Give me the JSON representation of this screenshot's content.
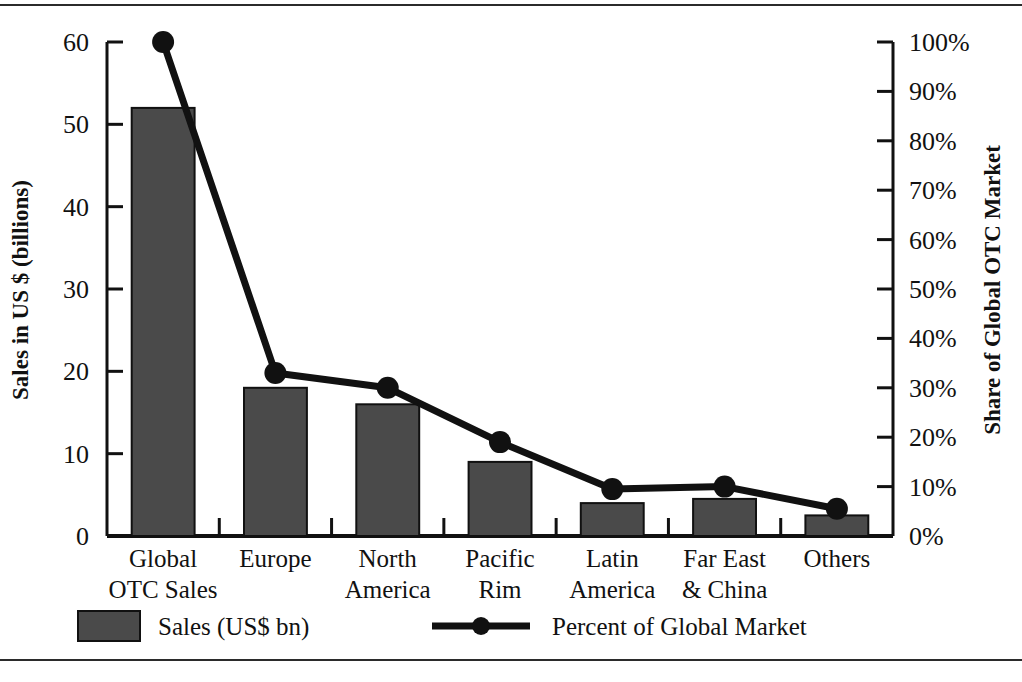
{
  "chart_data": {
    "type": "bar",
    "title": "",
    "subtitle": "",
    "categories": [
      "Global\nOTC Sales",
      "Europe",
      "North\nAmerica",
      "Pacific\nRim",
      "Latin\nAmerica",
      "Far East\n& China",
      "Others"
    ],
    "category_lines": [
      [
        "Global",
        "OTC Sales"
      ],
      [
        "Europe",
        ""
      ],
      [
        "North",
        "America"
      ],
      [
        "Pacific",
        "Rim"
      ],
      [
        "Latin",
        "America"
      ],
      [
        "Far East",
        "& China"
      ],
      [
        "Others",
        ""
      ]
    ],
    "series": [
      {
        "name": "Sales (US$ bn)",
        "type": "bar",
        "axis": "left",
        "color": "#4a4a4a",
        "values": [
          52,
          18,
          16,
          9,
          4,
          4.5,
          2.5
        ]
      },
      {
        "name": "Percent of Global Market",
        "type": "line",
        "axis": "right",
        "color": "#111111",
        "values": [
          100,
          33,
          30,
          19,
          9.5,
          10,
          5.5
        ]
      }
    ],
    "xlabel": "",
    "ylabel": "Sales in US $ (billions)",
    "y2label": "Share of Global OTC Market",
    "ylim": [
      0,
      60
    ],
    "y2lim": [
      0,
      100
    ],
    "yticks": [
      0,
      10,
      20,
      30,
      40,
      50,
      60
    ],
    "ytick_labels": [
      "0",
      "10",
      "20",
      "30",
      "40",
      "50",
      "60"
    ],
    "y2ticks": [
      0,
      10,
      20,
      30,
      40,
      50,
      60,
      70,
      80,
      90,
      100
    ],
    "y2tick_labels": [
      "0%",
      "10%",
      "20%",
      "30%",
      "40%",
      "50%",
      "60%",
      "70%",
      "80%",
      "90%",
      "100%"
    ],
    "grid": false,
    "legend_position": "bottom",
    "legend": [
      {
        "label": "Sales (US$ bn)",
        "marker": "swatch",
        "color": "#4a4a4a"
      },
      {
        "label": "Percent of Global Market",
        "marker": "line-dot",
        "color": "#111111"
      }
    ]
  },
  "axes": {
    "left_title": "Sales in US $ (billions)",
    "right_title": "Share of Global OTC Market"
  },
  "legend": {
    "bar_label": "Sales (US$ bn)",
    "line_label": "Percent of Global Market"
  }
}
